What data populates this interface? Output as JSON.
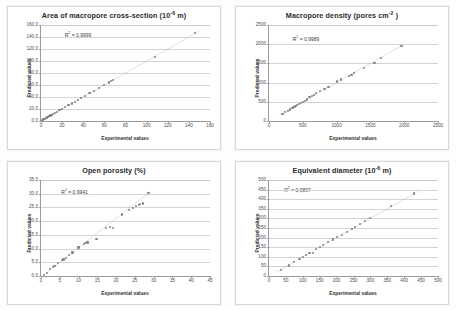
{
  "figure": {
    "axis_titles": {
      "x": "Experimental values",
      "y": "Predicted values"
    },
    "colors": {
      "marker": "#7f7f7f",
      "trendline": "#a6a6a6",
      "gridline": "#d3d3d3",
      "axis": "#9a9a9a",
      "title_text": "#2a2a2a",
      "panel_border": "#d8d8d8",
      "background": "#ffffff"
    }
  },
  "chart_data": [
    {
      "type": "scatter",
      "panel": "top-left",
      "title": "Area of macropore cross-section (10",
      "title_sup": "-6",
      "title_tail": " m)",
      "title_full": "Area of macropore cross-section (10-6 m)",
      "annotation": "R",
      "annotation_sup": "2",
      "annotation_tail": " = 0,9999",
      "annotation_full": "R2 = 0,9999",
      "xlabel": "Experimental values",
      "ylabel": "Predicted values",
      "xlim": [
        0,
        160
      ],
      "ylim": [
        0,
        160
      ],
      "xticks": [
        0,
        20,
        40,
        60,
        80,
        100,
        120,
        140,
        160
      ],
      "xticklabels": [
        "0",
        "20",
        "40",
        "60",
        "80",
        "100",
        "120",
        "140",
        "160"
      ],
      "yticks": [
        0,
        20,
        40,
        60,
        80,
        100,
        120,
        140,
        160
      ],
      "yticklabels": [
        "0,0",
        "20,0",
        "40,0",
        "60,0",
        "80,0",
        "100,0",
        "120,0",
        "140,0",
        "160,0"
      ],
      "grid": "horizontal",
      "legend": "none",
      "x": [
        1.5,
        2.2,
        3.0,
        3.8,
        4.5,
        5.4,
        6.2,
        7.0,
        8.1,
        9.0,
        10.2,
        11.5,
        13.0,
        15.0,
        17.5,
        20.0,
        23.0,
        26.0,
        29.0,
        32.0,
        35.0,
        38.0,
        42.0,
        46.0,
        50.0,
        55.0,
        60.0,
        64.0,
        66.0,
        68.0,
        108.0,
        146.0
      ],
      "y": [
        1.8,
        2.5,
        3.2,
        4.0,
        4.8,
        5.6,
        6.5,
        7.3,
        8.4,
        9.3,
        10.5,
        11.8,
        13.3,
        15.3,
        17.8,
        20.3,
        23.3,
        26.3,
        29.3,
        32.3,
        35.3,
        38.3,
        42.3,
        46.3,
        50.3,
        55.3,
        60.3,
        64.3,
        66.3,
        68.3,
        107.0,
        146.5
      ],
      "trendline": {
        "x0": 0,
        "y0": 0,
        "x1": 150,
        "y1": 150
      }
    },
    {
      "type": "scatter",
      "panel": "top-right",
      "title": "Macropore density (pores cm",
      "title_sup": "-2",
      "title_tail": " )",
      "title_full": "Macropore density (pores cm-2 )",
      "annotation": "R",
      "annotation_sup": "2",
      "annotation_tail": " = 0,9989",
      "annotation_full": "R2 = 0,9989",
      "xlabel": "Experimental values",
      "ylabel": "Predicted values",
      "xlim": [
        0,
        2500
      ],
      "ylim": [
        0,
        2500
      ],
      "xticks": [
        0,
        500,
        1000,
        1500,
        2000,
        2500
      ],
      "xticklabels": [
        "0",
        "500",
        "1000",
        "1500",
        "2000",
        "2500"
      ],
      "yticks": [
        0,
        500,
        1000,
        1500,
        2000,
        2500
      ],
      "yticklabels": [
        "0",
        "500",
        "1000",
        "1500",
        "2000",
        "2500"
      ],
      "grid": "horizontal",
      "legend": "none",
      "x": [
        200,
        240,
        280,
        310,
        340,
        360,
        380,
        400,
        420,
        440,
        470,
        500,
        530,
        560,
        600,
        640,
        660,
        700,
        760,
        820,
        880,
        1000,
        1060,
        1180,
        1220,
        1260,
        1400,
        1560,
        1660,
        1960
      ],
      "y": [
        180,
        230,
        270,
        300,
        330,
        350,
        380,
        400,
        420,
        450,
        470,
        500,
        520,
        560,
        620,
        650,
        680,
        720,
        780,
        830,
        890,
        1030,
        1080,
        1180,
        1200,
        1240,
        1370,
        1520,
        1650,
        1960
      ],
      "trendline": {
        "x0": 150,
        "y0": 150,
        "x1": 2000,
        "y1": 2000
      }
    },
    {
      "type": "scatter",
      "panel": "bottom-left",
      "title": "Open porosity (%)",
      "title_sup": "",
      "title_tail": "",
      "title_full": "Open porosity (%)",
      "annotation": "R",
      "annotation_sup": "2",
      "annotation_tail": " = 0,9941",
      "annotation_full": "R2 = 0,9941",
      "xlabel": "Experimental values",
      "ylabel": "Predicted values",
      "xlim": [
        0,
        45
      ],
      "ylim": [
        0,
        35
      ],
      "xticks": [
        0,
        5,
        10,
        15,
        20,
        25,
        30,
        35,
        40,
        45
      ],
      "xticklabels": [
        "0",
        "5",
        "10",
        "15",
        "20",
        "25",
        "30",
        "35",
        "40",
        "45"
      ],
      "yticks": [
        0,
        5,
        10,
        15,
        20,
        25,
        30,
        35
      ],
      "yticklabels": [
        "0,0",
        "5,0",
        "10,0",
        "15,0",
        "20,0",
        "25,0",
        "30,0",
        "35,0"
      ],
      "grid": "horizontal",
      "legend": "none",
      "x": [
        0.8,
        1.5,
        2.4,
        3.2,
        3.6,
        4.6,
        5.6,
        6.0,
        6.6,
        7.4,
        8.4,
        10.0,
        10.2,
        11.4,
        11.8,
        12.4,
        14.8,
        17.2,
        18.4,
        19.2,
        21.6,
        23.4,
        24.6,
        25.4,
        26.0,
        26.4,
        27.2,
        28.6
      ],
      "y": [
        0.4,
        1.2,
        2.6,
        3.2,
        3.6,
        4.6,
        5.8,
        6.0,
        6.6,
        7.6,
        8.6,
        10.4,
        10.6,
        11.6,
        12.0,
        12.2,
        13.4,
        17.4,
        18.0,
        17.4,
        22.4,
        24.0,
        24.8,
        25.6,
        26.0,
        26.2,
        26.4,
        30.4
      ],
      "trendline": {
        "x0": 0.5,
        "y0": 0.2,
        "x1": 29.0,
        "y1": 30.6
      }
    },
    {
      "type": "scatter",
      "panel": "bottom-right",
      "title": "Equivalent diameter (10",
      "title_sup": "-6",
      "title_tail": " m)",
      "title_full": "Equivalent diameter (10-6 m)",
      "annotation": "R",
      "annotation_sup": "2",
      "annotation_tail": " = 0,9897",
      "annotation_full": "R2 = 0,9897",
      "xlabel": "Experimental values",
      "ylabel": "Predicted values",
      "xlim": [
        0,
        500
      ],
      "ylim": [
        0,
        500
      ],
      "xticks": [
        0,
        50,
        100,
        150,
        200,
        250,
        300,
        350,
        400,
        450,
        500
      ],
      "xticklabels": [
        "0",
        "50",
        "100",
        "150",
        "200",
        "250",
        "300",
        "350",
        "400",
        "450",
        "500"
      ],
      "yticks": [
        0,
        50,
        100,
        150,
        200,
        250,
        300,
        350,
        400,
        450,
        500
      ],
      "yticklabels": [
        "0",
        "50",
        "100",
        "150",
        "200",
        "250",
        "300",
        "350",
        "400",
        "450",
        "500"
      ],
      "grid": "horizontal",
      "legend": "none",
      "x": [
        35,
        60,
        75,
        90,
        100,
        110,
        120,
        130,
        140,
        150,
        160,
        175,
        190,
        200,
        215,
        230,
        245,
        255,
        270,
        285,
        300,
        360,
        430
      ],
      "y": [
        30,
        55,
        75,
        90,
        100,
        110,
        118,
        120,
        140,
        150,
        160,
        175,
        190,
        205,
        215,
        230,
        245,
        255,
        270,
        285,
        300,
        365,
        430
      ],
      "trendline": {
        "x0": 20,
        "y0": 20,
        "x1": 440,
        "y1": 440
      }
    }
  ]
}
